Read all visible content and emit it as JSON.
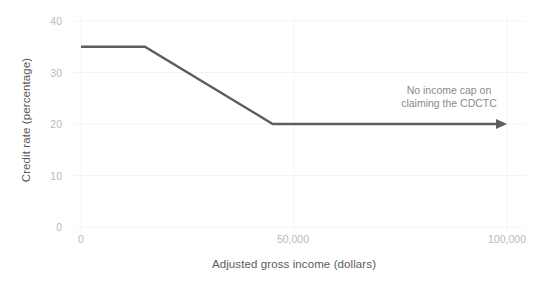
{
  "chart_data": {
    "type": "line",
    "title": "",
    "xlabel": "Adjusted gross income (dollars)",
    "ylabel": "Credit rate (percentage)",
    "xlim": [
      0,
      100000
    ],
    "ylim": [
      0,
      40
    ],
    "grid": true,
    "legend": "none",
    "x_ticks": [
      {
        "value": 0,
        "label": "0"
      },
      {
        "value": 50000,
        "label": "50,000"
      },
      {
        "value": 100000,
        "label": "100,000"
      }
    ],
    "y_ticks": [
      {
        "value": 0,
        "label": "0"
      },
      {
        "value": 10,
        "label": "10"
      },
      {
        "value": 20,
        "label": "20"
      },
      {
        "value": 30,
        "label": "30"
      },
      {
        "value": 40,
        "label": "40"
      }
    ],
    "series": [
      {
        "name": "CDCTC credit rate",
        "color": "#5e5e5e",
        "x": [
          0,
          15000,
          45000,
          100000
        ],
        "values": [
          35,
          35,
          20,
          20
        ],
        "arrow_end": true
      }
    ],
    "annotations": [
      {
        "id": "no-income-cap",
        "line1": "No income cap on",
        "line2": "claiming the CDCTC",
        "x": 95000,
        "y": 26,
        "color": "#8a8a8a"
      }
    ]
  },
  "colors": {
    "background": "#ffffff",
    "line": "#5e5e5e",
    "grid": "#f4f4f4",
    "tick_text": "#b9b9b9",
    "axis_title_text": "#5b5b5b",
    "annotation_text": "#8a8a8a"
  },
  "icons": {
    "arrow": "arrow-right-icon"
  }
}
